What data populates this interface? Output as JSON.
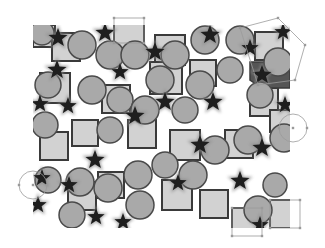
{
  "canvas": {
    "width": 325,
    "height": 248,
    "region": {
      "x": 33,
      "y": 25,
      "w": 257,
      "h": 203
    },
    "colors": {
      "background": "#ffffff",
      "square_fill": "#d2d2d2",
      "square_stroke": "#3a3a3a",
      "circle_fill": "#a9a9a9",
      "circle_stroke": "#4a4a4a",
      "star_fill": "#1e1e1e",
      "star_glow": "#8a8a8a",
      "selection": "#9a9a9a",
      "dark_region": "#555555"
    }
  },
  "shapes": {
    "squares": [
      {
        "x": 33,
        "y": 25,
        "s": 22
      },
      {
        "x": 52,
        "y": 33,
        "s": 28
      },
      {
        "x": 114,
        "y": 18,
        "s": 30
      },
      {
        "x": 155,
        "y": 35,
        "s": 30
      },
      {
        "x": 255,
        "y": 32,
        "s": 28
      },
      {
        "x": 40,
        "y": 73,
        "s": 30
      },
      {
        "x": 102,
        "y": 85,
        "s": 28
      },
      {
        "x": 150,
        "y": 62,
        "s": 32
      },
      {
        "x": 190,
        "y": 60,
        "s": 26
      },
      {
        "x": 250,
        "y": 88,
        "s": 28
      },
      {
        "x": 40,
        "y": 132,
        "s": 28
      },
      {
        "x": 72,
        "y": 120,
        "s": 26
      },
      {
        "x": 128,
        "y": 120,
        "s": 28
      },
      {
        "x": 170,
        "y": 130,
        "s": 30
      },
      {
        "x": 225,
        "y": 130,
        "s": 28
      },
      {
        "x": 270,
        "y": 110,
        "s": 22
      },
      {
        "x": 68,
        "y": 182,
        "s": 28
      },
      {
        "x": 98,
        "y": 172,
        "s": 26
      },
      {
        "x": 162,
        "y": 180,
        "s": 30
      },
      {
        "x": 200,
        "y": 190,
        "s": 28
      },
      {
        "x": 232,
        "y": 208,
        "s": 28
      },
      {
        "x": 270,
        "y": 200,
        "s": 28
      }
    ],
    "circles": [
      {
        "cx": 42,
        "cy": 33,
        "r": 12
      },
      {
        "cx": 82,
        "cy": 45,
        "r": 14
      },
      {
        "cx": 110,
        "cy": 55,
        "r": 14
      },
      {
        "cx": 135,
        "cy": 55,
        "r": 14
      },
      {
        "cx": 160,
        "cy": 80,
        "r": 14
      },
      {
        "cx": 175,
        "cy": 55,
        "r": 14
      },
      {
        "cx": 205,
        "cy": 40,
        "r": 14
      },
      {
        "cx": 240,
        "cy": 40,
        "r": 14
      },
      {
        "cx": 278,
        "cy": 62,
        "r": 14
      },
      {
        "cx": 48,
        "cy": 85,
        "r": 13
      },
      {
        "cx": 92,
        "cy": 90,
        "r": 14
      },
      {
        "cx": 120,
        "cy": 100,
        "r": 13
      },
      {
        "cx": 145,
        "cy": 110,
        "r": 14
      },
      {
        "cx": 200,
        "cy": 85,
        "r": 14
      },
      {
        "cx": 230,
        "cy": 70,
        "r": 13
      },
      {
        "cx": 260,
        "cy": 95,
        "r": 13
      },
      {
        "cx": 45,
        "cy": 125,
        "r": 13
      },
      {
        "cx": 110,
        "cy": 130,
        "r": 13
      },
      {
        "cx": 185,
        "cy": 110,
        "r": 13
      },
      {
        "cx": 215,
        "cy": 150,
        "r": 14
      },
      {
        "cx": 248,
        "cy": 140,
        "r": 14
      },
      {
        "cx": 284,
        "cy": 138,
        "r": 14
      },
      {
        "cx": 48,
        "cy": 180,
        "r": 13
      },
      {
        "cx": 80,
        "cy": 182,
        "r": 14
      },
      {
        "cx": 108,
        "cy": 188,
        "r": 14
      },
      {
        "cx": 138,
        "cy": 175,
        "r": 14
      },
      {
        "cx": 165,
        "cy": 165,
        "r": 13
      },
      {
        "cx": 193,
        "cy": 175,
        "r": 14
      },
      {
        "cx": 72,
        "cy": 215,
        "r": 13
      },
      {
        "cx": 140,
        "cy": 205,
        "r": 14
      },
      {
        "cx": 258,
        "cy": 210,
        "r": 14
      },
      {
        "cx": 275,
        "cy": 185,
        "r": 12
      }
    ],
    "stars": [
      {
        "cx": 58,
        "cy": 38,
        "r": 10
      },
      {
        "cx": 105,
        "cy": 33,
        "r": 10
      },
      {
        "cx": 155,
        "cy": 52,
        "r": 10
      },
      {
        "cx": 210,
        "cy": 35,
        "r": 10
      },
      {
        "cx": 250,
        "cy": 48,
        "r": 9
      },
      {
        "cx": 57,
        "cy": 70,
        "r": 10
      },
      {
        "cx": 120,
        "cy": 72,
        "r": 9
      },
      {
        "cx": 262,
        "cy": 75,
        "r": 10
      },
      {
        "cx": 283,
        "cy": 32,
        "r": 9
      },
      {
        "cx": 40,
        "cy": 104,
        "r": 9
      },
      {
        "cx": 68,
        "cy": 106,
        "r": 9
      },
      {
        "cx": 135,
        "cy": 116,
        "r": 10
      },
      {
        "cx": 165,
        "cy": 102,
        "r": 10
      },
      {
        "cx": 213,
        "cy": 102,
        "r": 10
      },
      {
        "cx": 285,
        "cy": 105,
        "r": 9
      },
      {
        "cx": 95,
        "cy": 160,
        "r": 10
      },
      {
        "cx": 200,
        "cy": 145,
        "r": 10
      },
      {
        "cx": 262,
        "cy": 148,
        "r": 10
      },
      {
        "cx": 42,
        "cy": 178,
        "r": 9
      },
      {
        "cx": 69,
        "cy": 185,
        "r": 9
      },
      {
        "cx": 178,
        "cy": 183,
        "r": 9
      },
      {
        "cx": 240,
        "cy": 181,
        "r": 10
      },
      {
        "cx": 38,
        "cy": 205,
        "r": 9
      },
      {
        "cx": 96,
        "cy": 217,
        "r": 9
      },
      {
        "cx": 123,
        "cy": 222,
        "r": 9
      },
      {
        "cx": 260,
        "cy": 225,
        "r": 9
      }
    ],
    "dark_region": {
      "points": "250,62 290,62 290,88 262,88 250,80"
    }
  },
  "selections": [
    {
      "type": "rect",
      "x": 114,
      "y": 18,
      "w": 30,
      "h": 25
    },
    {
      "type": "polygon",
      "points": "240,28 278,18 305,45 295,80 258,85"
    },
    {
      "type": "circle",
      "cx": 293,
      "cy": 128,
      "r": 14
    },
    {
      "type": "circle",
      "cx": 33,
      "cy": 185,
      "r": 14
    },
    {
      "type": "rect",
      "x": 232,
      "y": 208,
      "w": 30,
      "h": 28
    },
    {
      "type": "rect",
      "x": 270,
      "y": 200,
      "w": 30,
      "h": 28
    }
  ]
}
